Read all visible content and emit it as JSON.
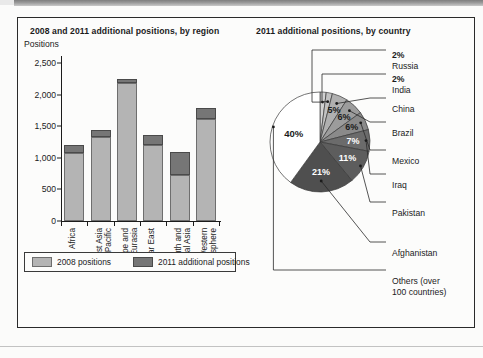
{
  "page": {
    "background": "#fbfbfa",
    "frame_border_color": "#2a2a2a"
  },
  "colors": {
    "series_2008": "#b4b4b4",
    "series_2011": "#767676",
    "ink": "#1b1b1b",
    "pie_others": "#ffffff",
    "pie_afghanistan": "#4f4f4f",
    "pie_pakistan": "#5d5d5d",
    "pie_iraq": "#6b6b6b",
    "pie_mexico": "#8a8a8a",
    "pie_brazil": "#9c9c9c",
    "pie_china": "#b0b0b0",
    "pie_india": "#c2c2c2",
    "pie_russia": "#d2d2d2"
  },
  "bar_chart": {
    "title": "2008 and 2011 additional positions, by region",
    "axis_label": "Positions",
    "legend": [
      {
        "label": "2008 positions",
        "swatch": "a"
      },
      {
        "label": "2011 additional positions",
        "swatch": "b"
      }
    ],
    "y_ticks": [
      "0",
      "500",
      "1,000",
      "1,500",
      "2,000",
      "2,500"
    ],
    "x_labels": [
      "Africa",
      "East Asia\nand Pacific",
      "Europe and\nEurasia",
      "Near East",
      "South and\nCentral Asia",
      "Western\nHemisphere"
    ]
  },
  "pie_chart": {
    "title": "2011 additional positions, by country",
    "labels": [
      {
        "pct": "2%",
        "name": "Russia"
      },
      {
        "pct": "2%",
        "name": "India"
      },
      {
        "pct": "",
        "name": "China"
      },
      {
        "pct": "",
        "name": "Brazil"
      },
      {
        "pct": "",
        "name": "Mexico"
      },
      {
        "pct": "",
        "name": "Iraq"
      },
      {
        "pct": "",
        "name": "Pakistan"
      },
      {
        "pct": "",
        "name": "Afghanistan"
      },
      {
        "pct": "",
        "name": "Others (over\n100 countries)"
      }
    ],
    "slice_labels": [
      "5%",
      "6%",
      "6%",
      "7%",
      "11%",
      "21%",
      "40%"
    ]
  },
  "chart_data": [
    {
      "type": "bar",
      "subtype": "stacked",
      "title": "2008 and 2011 additional positions, by region",
      "xlabel": "",
      "ylabel": "Positions",
      "ylim": [
        0,
        2500
      ],
      "yticks": [
        0,
        500,
        1000,
        1500,
        2000,
        2500
      ],
      "grid": false,
      "legend_position": "bottom",
      "categories": [
        "Africa",
        "East Asia and Pacific",
        "Europe and Eurasia",
        "Near East",
        "South and Central Asia",
        "Western Hemisphere"
      ],
      "series": [
        {
          "name": "2008 positions",
          "values": [
            1080,
            1330,
            2180,
            1200,
            725,
            1615
          ]
        },
        {
          "name": "2011 additional positions",
          "values": [
            120,
            115,
            70,
            165,
            375,
            175
          ]
        }
      ],
      "totals": [
        1200,
        1445,
        2250,
        1365,
        1100,
        1790
      ]
    },
    {
      "type": "pie",
      "title": "2011 additional positions, by country",
      "labels": [
        "Russia",
        "India",
        "China",
        "Brazil",
        "Mexico",
        "Iraq",
        "Pakistan",
        "Afghanistan",
        "Others (over 100 countries)"
      ],
      "values": [
        2,
        2,
        5,
        6,
        6,
        7,
        11,
        21,
        40
      ],
      "value_suffix": "%",
      "legend_position": "right-leader-lines"
    }
  ]
}
